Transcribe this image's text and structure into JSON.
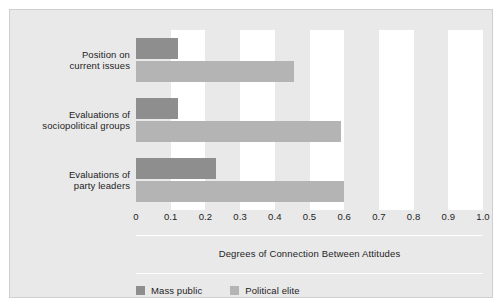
{
  "chart_data": {
    "type": "bar",
    "orientation": "horizontal",
    "title": "",
    "xlabel": "Degrees of Connection Between Attitudes",
    "ylabel": "",
    "xlim": [
      0,
      1.0
    ],
    "grid": "alternating vertical bands",
    "legend_position": "bottom-left",
    "categories": [
      "Position on\ncurrent issues",
      "Evaluations of\nsociopolitical groups",
      "Evaluations of\nparty leaders"
    ],
    "category_lines": [
      [
        "Position on",
        "current issues"
      ],
      [
        "Evaluations of",
        "sociopolitical groups"
      ],
      [
        "Evaluations of",
        "party leaders"
      ]
    ],
    "series": [
      {
        "name": "Mass public",
        "color": "#8e8e8e",
        "values": [
          0.12,
          0.12,
          0.23
        ]
      },
      {
        "name": "Political elite",
        "color": "#b4b4b4",
        "values": [
          0.455,
          0.59,
          0.6
        ]
      }
    ],
    "xticks": [
      0,
      0.1,
      0.2,
      0.3,
      0.4,
      0.5,
      0.6,
      0.7,
      0.8,
      0.9,
      1.0
    ],
    "xtick_labels": [
      "0",
      "0.1",
      "0.2",
      "0.3",
      "0.4",
      "0.5",
      "0.6",
      "0.7",
      "0.8",
      "0.9",
      "1.0"
    ]
  },
  "axis": {
    "title": "Degrees of Connection Between Attitudes"
  },
  "legend": {
    "items": [
      {
        "label": "Mass public",
        "color": "#8e8e8e"
      },
      {
        "label": "Political elite",
        "color": "#b4b4b4"
      }
    ]
  },
  "colors": {
    "background": "#e9e9e9",
    "band": "#ffffff",
    "mass_public": "#8e8e8e",
    "political_elite": "#b4b4b4",
    "text": "#1d1d1d"
  }
}
